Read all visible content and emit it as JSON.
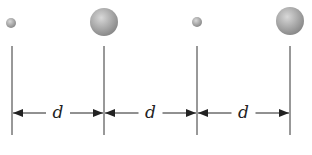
{
  "diagram": {
    "type": "physics-spacing",
    "spheres": [
      {
        "id": "sphere-1",
        "size": "small",
        "cx": 11,
        "cy": 23,
        "r": 5
      },
      {
        "id": "sphere-2",
        "size": "large",
        "cx": 104,
        "cy": 22,
        "r": 14
      },
      {
        "id": "sphere-3",
        "size": "small",
        "cx": 197,
        "cy": 22,
        "r": 5
      },
      {
        "id": "sphere-4",
        "size": "large",
        "cx": 290,
        "cy": 21,
        "r": 14
      }
    ],
    "vertical_lines_x": [
      12,
      104,
      197,
      290
    ],
    "line_top": 46,
    "line_bottom": 135,
    "arrow_y": 113,
    "dimensions": [
      {
        "label": "d",
        "x1": 12,
        "x2": 104
      },
      {
        "label": "d",
        "x1": 104,
        "x2": 197
      },
      {
        "label": "d",
        "x1": 197,
        "x2": 290
      }
    ],
    "colors": {
      "line": "#333333",
      "sphere_light": "#dcdcdc",
      "sphere_dark": "#8a8a8a"
    }
  }
}
